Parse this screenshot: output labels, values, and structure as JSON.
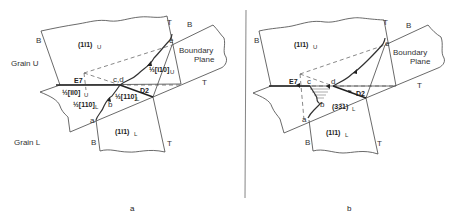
{
  "panel_a": {
    "caption": "a",
    "grain_upper_label": "Grain U",
    "grain_lower_label": "Grain L",
    "plane_upper": "(1ī1)",
    "plane_upper_sub": "U",
    "plane_lower": "(1ī1)",
    "plane_lower_sub": "L",
    "boundary_label_1": "Boundary",
    "boundary_label_2": "Plane",
    "edge_labels": {
      "B_upper_left": "B",
      "T_upper_right": "T",
      "B_boundary_top": "B",
      "T_boundary_bottom": "T",
      "B_lower_left": "B",
      "T_lower_right": "T"
    },
    "points": {
      "a": "a",
      "b": "b",
      "cd": "c,d",
      "e": "e"
    },
    "dislocations": {
      "E7": "E7",
      "D2": "D2"
    },
    "burgers_vectors": {
      "upper_e": "½[ī10]",
      "upper_e_sub": "U",
      "upper_E7": "½[īī0]",
      "upper_E7_sub": "U",
      "lower_ab": "½[110]",
      "lower_ab_sub": "L",
      "lower_D2": "½[110]",
      "lower_D2_sub": "L"
    }
  },
  "panel_b": {
    "caption": "b",
    "plane_upper": "(1ī1)",
    "plane_upper_sub": "U",
    "plane_lower": "(1ī1)",
    "plane_lower_sub": "L",
    "plane_mid": "(3ķ3ī1)",
    "plane_mid_text": "(33̅1)",
    "plane_mid_sub": "L",
    "boundary_label_1": "Boundary",
    "boundary_label_2": "Plane",
    "edge_labels": {
      "B_upper_left": "B",
      "T_upper_right": "T",
      "B_boundary_top": "B",
      "T_boundary_bottom": "T",
      "B_lower_left": "B",
      "T_lower_right": "T"
    },
    "points": {
      "a": "a",
      "b": "b",
      "c": "c",
      "d": "d",
      "e": "e"
    },
    "dislocations": {
      "E7": "E7",
      "D2": "D2"
    }
  }
}
